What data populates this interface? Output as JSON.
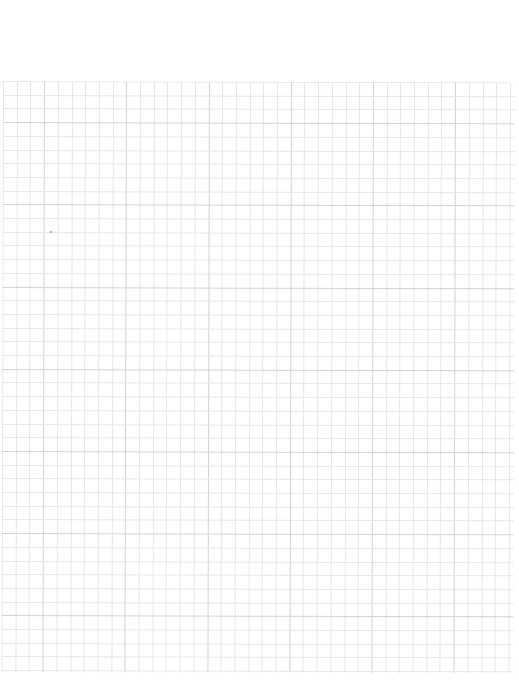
{
  "document": {
    "type": "graph-paper-sheet",
    "background_color": "#ffffff",
    "grid": {
      "left": 3,
      "top": 81,
      "width": 512,
      "height": 591,
      "cell_size": 13.7,
      "columns": 37,
      "rows": 43,
      "minor_line_color": "#e6e6e6",
      "major_line_color": "#d2d2d2",
      "major_every": 6
    },
    "marks": [
      {
        "type": "speck",
        "x": 50,
        "y": 231
      }
    ]
  }
}
